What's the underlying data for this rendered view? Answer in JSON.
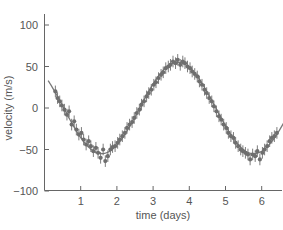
{
  "chart_data": {
    "type": "scatter",
    "title": "",
    "xlabel": "time (days)",
    "ylabel": "velocity (m/s)",
    "xlim": [
      0,
      6.6
    ],
    "ylim": [
      -100,
      120
    ],
    "x_ticks": [
      1,
      2,
      3,
      4,
      5,
      6
    ],
    "x_tick_labels": [
      "1",
      "2",
      "3",
      "4",
      "5",
      "6"
    ],
    "y_ticks": [
      -100,
      -50,
      0,
      50,
      100
    ],
    "y_tick_labels": [
      "−100",
      "−50",
      "0",
      "50",
      "100"
    ],
    "grid": false,
    "legend": null,
    "colors": {
      "axis": "#666666",
      "points": "#6e6e6e",
      "fit_line": "#7a7a7a",
      "text": "#555555"
    },
    "fit_curve": {
      "name": "sinusoidal fit",
      "model": "v = K*cos(2*pi*(t - t_max)/P)",
      "K": 55,
      "P": 4.2,
      "t_max": 3.68,
      "x_range": [
        0.1,
        6.6
      ]
    },
    "series": [
      {
        "name": "observations",
        "error_bar": 7,
        "x": [
          0.3,
          0.36,
          0.42,
          0.48,
          0.55,
          0.62,
          0.68,
          0.75,
          0.82,
          0.88,
          0.95,
          1.02,
          1.08,
          1.15,
          1.22,
          1.28,
          1.35,
          1.42,
          1.48,
          1.55,
          1.62,
          1.68,
          1.75,
          1.82,
          1.88,
          1.95,
          2.02,
          2.08,
          2.15,
          2.22,
          2.28,
          2.35,
          2.42,
          2.48,
          2.55,
          2.62,
          2.68,
          2.75,
          2.82,
          2.88,
          2.95,
          3.02,
          3.08,
          3.15,
          3.22,
          3.28,
          3.35,
          3.42,
          3.48,
          3.55,
          3.62,
          3.68,
          3.75,
          3.82,
          3.88,
          3.95,
          4.02,
          4.08,
          4.15,
          4.22,
          4.28,
          4.35,
          4.42,
          4.48,
          4.55,
          4.62,
          4.68,
          4.75,
          4.82,
          4.88,
          4.95,
          5.02,
          5.08,
          5.15,
          5.22,
          5.28,
          5.35,
          5.42,
          5.48,
          5.55,
          5.62,
          5.68,
          5.75,
          5.82,
          5.88,
          5.95,
          6.02,
          6.08,
          6.15,
          6.22,
          6.28,
          6.35,
          6.42
        ],
        "y": [
          20,
          12,
          8,
          3,
          -2,
          -8,
          -4,
          -20,
          -16,
          -26,
          -32,
          -30,
          -38,
          -44,
          -40,
          -46,
          -52,
          -48,
          -54,
          -60,
          -50,
          -64,
          -58,
          -50,
          -47,
          -46,
          -42,
          -38,
          -34,
          -30,
          -24,
          -20,
          -17,
          -12,
          -6,
          -2,
          4,
          8,
          14,
          18,
          22,
          28,
          31,
          36,
          40,
          43,
          48,
          50,
          52,
          56,
          54,
          58,
          52,
          56,
          54,
          50,
          48,
          44,
          41,
          38,
          32,
          28,
          22,
          18,
          12,
          8,
          2,
          -4,
          -10,
          -14,
          -20,
          -24,
          -30,
          -34,
          -36,
          -42,
          -46,
          -50,
          -52,
          -54,
          -56,
          -62,
          -56,
          -58,
          -52,
          -62,
          -54,
          -50,
          -46,
          -40,
          -36,
          -34,
          -30
        ]
      }
    ]
  }
}
